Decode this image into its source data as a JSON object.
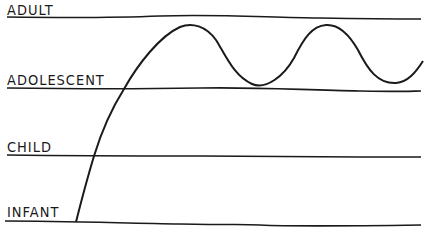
{
  "diagram": {
    "type": "developmental-stages-curve",
    "stages": [
      {
        "label": "ADULT",
        "line_y": 18,
        "label_top": 4
      },
      {
        "label": "ADOLESCENT",
        "line_y": 89,
        "label_top": 74
      },
      {
        "label": "CHILD",
        "line_y": 156,
        "label_top": 141
      },
      {
        "label": "INFANT",
        "line_y": 222,
        "label_top": 206
      }
    ],
    "curve": {
      "description": "Line rising from infant through child to above adolescent, then oscillating between near-adult and adolescent levels",
      "points": [
        [
          76,
          222
        ],
        [
          94,
          156
        ],
        [
          124,
          89
        ],
        [
          150,
          50
        ],
        [
          185,
          26
        ],
        [
          215,
          40
        ],
        [
          235,
          72
        ],
        [
          255,
          85
        ],
        [
          285,
          70
        ],
        [
          305,
          35
        ],
        [
          323,
          25
        ],
        [
          345,
          35
        ],
        [
          375,
          78
        ],
        [
          400,
          82
        ],
        [
          423,
          60
        ]
      ]
    },
    "colors": {
      "ink": "#1a1a1a",
      "background": "#ffffff"
    }
  }
}
